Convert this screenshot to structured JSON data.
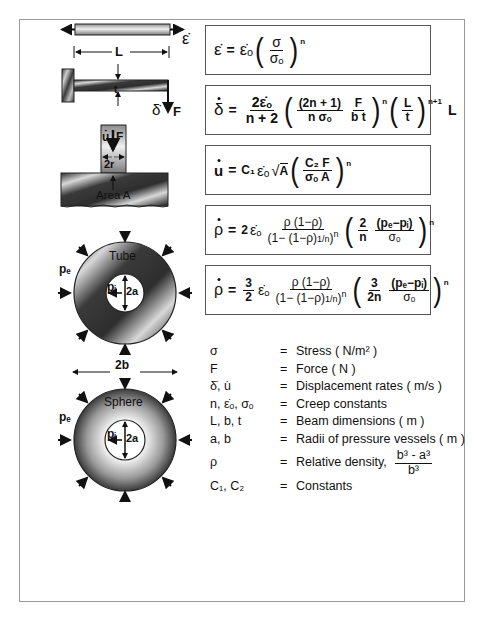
{
  "figure": {
    "diagram_labels": {
      "strain_rate": "ε̇",
      "length": "L",
      "thickness": "t",
      "deflection_rate": "δ̇",
      "force": "F",
      "indent_rate": "u̇",
      "indent_force": "F",
      "radius": "2r",
      "area": "Area A",
      "tube": "Tube",
      "sphere": "Sphere",
      "outer_pressure_tube": "pₑ",
      "inner_pressure_tube": "pᵢ",
      "inner_diameter_tube": "2a",
      "outer_diameter": "2b",
      "outer_pressure_sphere": "pₑ",
      "inner_pressure_sphere": "pᵢ",
      "inner_diameter_sphere": "2a"
    },
    "equations": [
      {
        "id": "uniaxial",
        "lhs": "ε̇",
        "rhs": "ε̇ₒ (σ/σₒ)ⁿ"
      },
      {
        "id": "beam",
        "lhs": "δ̇",
        "rhs": "2ε̇ₒ/(n+2) ((2n+1)/(n σₒ) F/(b t))ⁿ (L/t)ⁿ⁺¹ L"
      },
      {
        "id": "indentation",
        "lhs": "u̇",
        "rhs": "C₁ ε̇ₒ √A (C₂ F/(σₒ A))ⁿ"
      },
      {
        "id": "tube",
        "lhs": "ρ̇",
        "rhs": "2ε̇ₒ ρ(1−ρ)/(1−(1−ρ)^(1/n))ⁿ (2/n (pₑ−pᵢ)/σₒ)ⁿ"
      },
      {
        "id": "sphere",
        "lhs": "ρ̇",
        "rhs": "3/2 ε̇ₒ ρ(1−ρ)/(1−(1−ρ)^(1/n))ⁿ (3/(2n) (pₑ−pᵢ)/σₒ)ⁿ"
      }
    ],
    "eq_parts": {
      "eq": "=",
      "n": "n",
      "np1": "n+1",
      "two": "2",
      "three": "3",
      "sigma": "σ",
      "sigma_o": "σₒ",
      "edot": "ε̇",
      "edot_o": "ε̇ₒ",
      "delta": "δ",
      "u": "u",
      "rho": "ρ",
      "two_edot_o": "2ε̇ₒ",
      "n_plus_2": "n + 2",
      "two_n_plus_1": "(2n + 1)",
      "n_sigma_o": "n σₒ",
      "F": "F",
      "bt": "b t",
      "L": "L",
      "t": "t",
      "c1": "C₁",
      "A": "A",
      "c2F": "C₂ F",
      "sigma_o_A": "σₒ A",
      "rho_num": "ρ (1−ρ)",
      "rho_den": "(1− (1−ρ)",
      "one_over_n": "1/n",
      "pe_pi": "(pₑ−pᵢ)",
      "two_n": "2n"
    },
    "legend": [
      {
        "symbol": "σ",
        "eq": "=",
        "description": "Stress ( N/m² )"
      },
      {
        "symbol": "F",
        "eq": "=",
        "description": "Force ( N )"
      },
      {
        "symbol": "δ̇, u̇",
        "eq": "=",
        "description": "Displacement rates ( m/s )"
      },
      {
        "symbol": "n, ε̇ₒ, σₒ",
        "eq": "=",
        "description": "Creep constants"
      },
      {
        "symbol": "L, b, t",
        "eq": "=",
        "description": "Beam dimensions ( m )"
      },
      {
        "symbol": "a, b",
        "eq": "=",
        "description": "Radii of pressure vessels ( m )"
      },
      {
        "symbol": "ρ",
        "eq": "=",
        "description": "Relative density,",
        "frac_num": "b³ - a³",
        "frac_den": "b³"
      },
      {
        "symbol": "C₁, C₂",
        "eq": "=",
        "description": "Constants"
      }
    ]
  }
}
